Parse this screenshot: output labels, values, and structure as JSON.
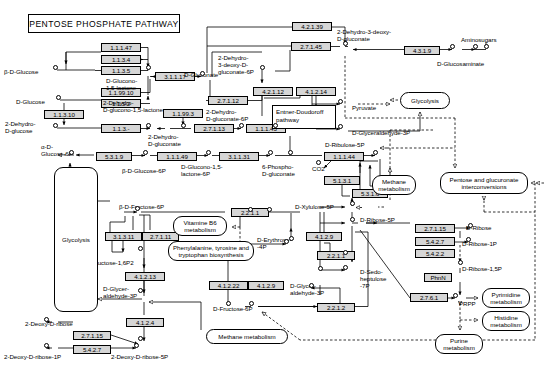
{
  "title": "PENTOSE PHOSPHATE PATHWAY",
  "enzymes": [
    {
      "id": "ec-1-1-1-47",
      "label": "1.1.1.47",
      "x": 101,
      "y": 43,
      "w": 40,
      "bold": false
    },
    {
      "id": "ec-1-1-3-4",
      "label": "1.1.3.4",
      "x": 101,
      "y": 55,
      "w": 40,
      "bold": true
    },
    {
      "id": "ec-1-1-3-5",
      "label": "1.1.3.5",
      "x": 101,
      "y": 66,
      "w": 40,
      "bold": false
    },
    {
      "id": "ec-3-1-1-17",
      "label": "3.1.1.17",
      "x": 155,
      "y": 72,
      "w": 40,
      "bold": false
    },
    {
      "id": "ec-1-1-99-10",
      "label": "1.1.99.10",
      "x": 101,
      "y": 88,
      "w": 40,
      "bold": false
    },
    {
      "id": "ec-1-1-5-2",
      "label": "1.1.5.2",
      "x": 101,
      "y": 99,
      "w": 40,
      "bold": false
    },
    {
      "id": "ec-1-1-3-10",
      "label": "1.1.3.10",
      "x": 44,
      "y": 110,
      "w": 40,
      "bold": false
    },
    {
      "id": "ec-1-1-3-",
      "label": "1.1.3.-",
      "x": 101,
      "y": 124,
      "w": 40,
      "bold": false
    },
    {
      "id": "ec-1-1-99-3",
      "label": "1.1.99.3",
      "x": 163,
      "y": 109,
      "w": 40,
      "bold": false
    },
    {
      "id": "ec-2-7-1-12",
      "label": "2.7.1.12",
      "x": 208,
      "y": 96,
      "w": 40,
      "bold": false
    },
    {
      "id": "ec-2-7-1-13",
      "label": "2.7.1.13",
      "x": 194,
      "y": 124,
      "w": 40,
      "bold": false
    },
    {
      "id": "ec-1-1-1-43",
      "label": "1.1.1.43",
      "x": 246,
      "y": 124,
      "w": 40,
      "bold": false
    },
    {
      "id": "ec-5-3-1-9-a",
      "label": "5.3.1.9",
      "x": 96,
      "y": 152,
      "w": 36,
      "bold": false
    },
    {
      "id": "ec-5-3-1-9-b",
      "label": "5.3.1.9",
      "x": 59,
      "y": 180,
      "w": 36,
      "bold": false
    },
    {
      "id": "ec-1-1-1-49",
      "label": "1.1.1.49",
      "x": 157,
      "y": 152,
      "w": 40,
      "bold": false
    },
    {
      "id": "ec-3-1-1-31",
      "label": "3.1.1.31",
      "x": 219,
      "y": 152,
      "w": 40,
      "bold": false
    },
    {
      "id": "ec-1-1-1-44",
      "label": "1.1.1.44",
      "x": 324,
      "y": 152,
      "w": 40,
      "bold": false
    },
    {
      "id": "ec-4-2-1-39",
      "label": "4.2.1.39",
      "x": 292,
      "y": 22,
      "w": 40,
      "bold": false
    },
    {
      "id": "ec-2-7-1-45",
      "label": "2.7.1.45",
      "x": 291,
      "y": 42,
      "w": 40,
      "bold": false
    },
    {
      "id": "ec-4-3-1-9",
      "label": "4.3.1.9",
      "x": 404,
      "y": 46,
      "w": 36,
      "bold": false
    },
    {
      "id": "ec-4-2-1-12",
      "label": "4.2.1.12",
      "x": 253,
      "y": 87,
      "w": 40,
      "bold": false
    },
    {
      "id": "ec-4-1-2-14",
      "label": "4.1.2.14",
      "x": 296,
      "y": 87,
      "w": 40,
      "bold": false
    },
    {
      "id": "ec-5-1-3-1",
      "label": "5.1.3.1",
      "x": 324,
      "y": 176,
      "w": 36,
      "bold": true
    },
    {
      "id": "ec-5-3-1-6",
      "label": "5.3.1.6",
      "x": 352,
      "y": 189,
      "w": 36,
      "bold": false
    },
    {
      "id": "ec-2-2-1-1-a",
      "label": "2.2.1.1",
      "x": 231,
      "y": 208,
      "w": 38,
      "bold": true
    },
    {
      "id": "ec-3-1-3-11",
      "label": "3.1.3.11",
      "x": 105,
      "y": 232,
      "w": 37,
      "bold": false
    },
    {
      "id": "ec-2-7-1-11",
      "label": "2.7.1.11",
      "x": 142,
      "y": 232,
      "w": 37,
      "bold": false
    },
    {
      "id": "ec-4-1-2-13",
      "label": "4.1.2.13",
      "x": 125,
      "y": 272,
      "w": 40,
      "bold": false
    },
    {
      "id": "ec-4-1-2-22",
      "label": "4.1.2.22",
      "x": 209,
      "y": 281,
      "w": 39,
      "bold": false
    },
    {
      "id": "ec-4-1-2-9-a",
      "label": "4.1.2.9",
      "x": 248,
      "y": 281,
      "w": 36,
      "bold": false
    },
    {
      "id": "ec-4-1-2-9-b",
      "label": "4.1.2.9",
      "x": 306,
      "y": 232,
      "w": 36,
      "bold": false
    },
    {
      "id": "ec-2-2-1-1-b",
      "label": "2.2.1.1",
      "x": 317,
      "y": 251,
      "w": 38,
      "bold": true
    },
    {
      "id": "ec-2-2-1-2",
      "label": "2.2.1.2",
      "x": 317,
      "y": 303,
      "w": 38,
      "bold": true
    },
    {
      "id": "ec-4-1-2-4",
      "label": "4.1.2.4",
      "x": 126,
      "y": 318,
      "w": 38,
      "bold": false
    },
    {
      "id": "ec-2-7-1-15",
      "label": "2.7.1.15",
      "x": 73,
      "y": 331,
      "w": 38,
      "bold": false
    },
    {
      "id": "ec-5-4-2-7",
      "label": "5.4.2.7",
      "x": 73,
      "y": 345,
      "w": 38,
      "bold": false
    },
    {
      "id": "ec-2-7-1-15-r",
      "label": "2.7.1.15",
      "x": 415,
      "y": 224,
      "w": 40,
      "bold": false
    },
    {
      "id": "ec-5-4-2-7-r",
      "label": "5.4.2.7",
      "x": 415,
      "y": 237,
      "w": 40,
      "bold": true
    },
    {
      "id": "ec-5-4-2-2",
      "label": "5.4.2.2",
      "x": 415,
      "y": 249,
      "w": 40,
      "bold": false
    },
    {
      "id": "ec-phnn",
      "label": "PhnN",
      "x": 424,
      "y": 273,
      "w": 28,
      "bold": false
    },
    {
      "id": "ec-2-7-6-1",
      "label": "2.7.6.1",
      "x": 410,
      "y": 293,
      "w": 38,
      "bold": true
    }
  ],
  "compounds": [
    {
      "id": "beta-d-glucose",
      "text": "β-D-Glucose",
      "x": 4,
      "y": 68,
      "align": "left"
    },
    {
      "id": "d-glucose",
      "text": "D-Glucose",
      "x": 16,
      "y": 98,
      "align": "left"
    },
    {
      "id": "2-dehydro-d-glucose",
      "text": "2-Dehydro-\nD-glucose",
      "x": 5,
      "y": 120,
      "align": "left"
    },
    {
      "id": "d-glucono-1-5-lactone",
      "text": "D-Glucono-\n1,5-lactone",
      "x": 106,
      "y": 77,
      "align": "left"
    },
    {
      "id": "2-dehydro-d-glucono-1-5-lactone",
      "text": "2-Dehydro-\nD-glucono-1,5-lactone",
      "x": 103,
      "y": 99,
      "align": "left"
    },
    {
      "id": "2-dehydro-d-gluconate",
      "text": "2-Dehydro-\nD-gluconate",
      "x": 148,
      "y": 133,
      "align": "left"
    },
    {
      "id": "d-gluconate",
      "text": "D-Gluconate",
      "x": 184,
      "y": 71,
      "align": "left"
    },
    {
      "id": "2-dehydro-d-gluconate-6p",
      "text": "2-Dehydro-\nD-gluconate-6P",
      "x": 206,
      "y": 108,
      "align": "left"
    },
    {
      "id": "2-dehydro-3-deoxy-d-gluconate-6p",
      "text": "2-Dehydro-\n3-deoxy-D-\ngluconate-6P",
      "x": 218,
      "y": 54,
      "align": "left"
    },
    {
      "id": "2-dehydro-3-deoxy-d-gluconate",
      "text": "2-Dehydro-3-deoxy-\nD-gluconate",
      "x": 337,
      "y": 28,
      "align": "left"
    },
    {
      "id": "d-glucosaminate",
      "text": "D-Glucosaminate",
      "x": 437,
      "y": 60,
      "align": "left"
    },
    {
      "id": "aminosugars",
      "text": "Aminosugars",
      "x": 461,
      "y": 36,
      "align": "left"
    },
    {
      "id": "pyruvate",
      "text": "Pyruvate",
      "x": 352,
      "y": 104,
      "align": "left"
    },
    {
      "id": "d-glyceraldehyde-3p",
      "text": "D-Glyceraldehyde-3P",
      "x": 352,
      "y": 129,
      "align": "left"
    },
    {
      "id": "alpha-d-glucose-6p",
      "text": "α-D-\nGlucose-6P",
      "x": 41,
      "y": 143,
      "align": "left"
    },
    {
      "id": "beta-d-glucose-6p",
      "text": "β-D-Glucose-6P",
      "x": 122,
      "y": 167,
      "align": "left"
    },
    {
      "id": "d-glucono-1-5-lactone-6p",
      "text": "D-Glucono-1,5-\nlactone-6P",
      "x": 181,
      "y": 163,
      "align": "left"
    },
    {
      "id": "6-phospho-d-gluconate",
      "text": "6-Phospho-\nD-gluconate",
      "x": 262,
      "y": 163,
      "align": "left"
    },
    {
      "id": "co2",
      "text": "CO2",
      "x": 312,
      "y": 165,
      "align": "left"
    },
    {
      "id": "d-ribulose-5p",
      "text": "D-Ribulose-5P",
      "x": 325,
      "y": 141,
      "align": "left"
    },
    {
      "id": "d-xylulose-5p",
      "text": "D-Xylulose-5P",
      "x": 295,
      "y": 203,
      "align": "left"
    },
    {
      "id": "d-ribose-5p",
      "text": "D-Ribose-5P",
      "x": 360,
      "y": 216,
      "align": "left"
    },
    {
      "id": "d-ribose",
      "text": "D-Ribose",
      "x": 466,
      "y": 224,
      "align": "left"
    },
    {
      "id": "d-ribose-1p",
      "text": "D-Ribose-1P",
      "x": 462,
      "y": 240,
      "align": "left"
    },
    {
      "id": "d-ribose-1-5p",
      "text": "D-Ribose-1,5P",
      "x": 462,
      "y": 265,
      "align": "left"
    },
    {
      "id": "prpp",
      "text": "PRPP",
      "x": 459,
      "y": 300,
      "align": "left"
    },
    {
      "id": "beta-d-fructose-6p",
      "text": "β-D-Fructose-6P",
      "x": 119,
      "y": 203,
      "align": "left"
    },
    {
      "id": "beta-d-fructose-16p2",
      "text": "β-D-Fructose-1,6P2",
      "x": 80,
      "y": 259,
      "align": "left"
    },
    {
      "id": "d-glyceraldehyde-3p-left",
      "text": "D-Glycer-\naldehyde-3P",
      "x": 103,
      "y": 285,
      "align": "left"
    },
    {
      "id": "d-erythrose-4p",
      "text": "D-Erythrose-\n-4P",
      "x": 257,
      "y": 236,
      "align": "left"
    },
    {
      "id": "d-sedoheptulose-7p",
      "text": "D-Sedo-\nheptulose\n-7P",
      "x": 360,
      "y": 268,
      "align": "left"
    },
    {
      "id": "d-glyceraldehyde-3p-mid",
      "text": "D-Glycer-\naldehyde-3P",
      "x": 290,
      "y": 282,
      "align": "left"
    },
    {
      "id": "d-fructose-6p",
      "text": "D-Fructose-6P",
      "x": 213,
      "y": 305,
      "align": "left"
    },
    {
      "id": "2-deoxy-d-ribose",
      "text": "2-Deoxy-D-ribose",
      "x": 25,
      "y": 320,
      "align": "left"
    },
    {
      "id": "2-deoxy-d-ribose-1p",
      "text": "2-Deoxy-D-ribose-1P",
      "x": 4,
      "y": 353,
      "align": "left"
    },
    {
      "id": "2-deoxy-d-ribose-5p",
      "text": "2-Deoxy-D-ribose-5P",
      "x": 111,
      "y": 353,
      "align": "left"
    }
  ],
  "maplinks": [
    {
      "id": "glycolysis-left",
      "text": "Glycolysis",
      "x": 54,
      "y": 167,
      "w": 44,
      "h": 145
    },
    {
      "id": "glycolysis-right",
      "text": "Glycolysis",
      "x": 400,
      "y": 92,
      "w": 50,
      "h": 17
    },
    {
      "id": "vitamine-b6-metabolism",
      "text": "Vitamine B6\nmetabolism",
      "x": 173,
      "y": 216,
      "w": 54,
      "h": 20
    },
    {
      "id": "phenylalanine-tyrosine-tryptophan",
      "text": "Phenylalanine, tyrosine and\ntryptophan biosynthesis",
      "x": 168,
      "y": 241,
      "w": 86,
      "h": 20
    },
    {
      "id": "methane-metabolism-mid",
      "text": "Methane\nmetabolism",
      "x": 372,
      "y": 175,
      "w": 44,
      "h": 20
    },
    {
      "id": "pentose-glucuronate",
      "text": "Pentose and glucuronate\ninterconversions",
      "x": 440,
      "y": 172,
      "w": 88,
      "h": 22
    },
    {
      "id": "pyrimidine-metabolism",
      "text": "Pyrimidine\nmetabolism",
      "x": 482,
      "y": 288,
      "w": 48,
      "h": 20
    },
    {
      "id": "histidine-metabolism",
      "text": "Histidine\nmetabolism",
      "x": 482,
      "y": 311,
      "w": 48,
      "h": 20
    },
    {
      "id": "purine-metabolism",
      "text": "Purine\nmetabolism",
      "x": 435,
      "y": 334,
      "w": 48,
      "h": 20
    },
    {
      "id": "methane-metabolism-bottom",
      "text": "Methane metabolism",
      "x": 206,
      "y": 329,
      "w": 82,
      "h": 15
    }
  ],
  "plainboxes": [
    {
      "id": "entner-doudoroff-pathway",
      "text": "Entner-Doudoroff\npathway",
      "x": 272,
      "y": 105,
      "w": 64,
      "h": 24
    }
  ]
}
